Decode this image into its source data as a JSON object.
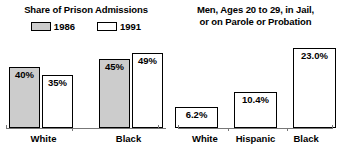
{
  "figure": {
    "background_color": "#ffffff",
    "bar_outline_color": "#000000",
    "axis_color": "#777777"
  },
  "left_panel": {
    "title": "Share of Prison Admissions",
    "legend": [
      {
        "label": "1986",
        "swatch": "gray-swatch-icon",
        "color": "#cccccc"
      },
      {
        "label": "1991",
        "swatch": "white-swatch-icon",
        "color": "#ffffff"
      }
    ]
  },
  "right_panel": {
    "title_line1": "Men, Ages 20 to 29, in Jail,",
    "title_line2": "or on Parole or Probation"
  },
  "chart_data": [
    {
      "type": "bar",
      "title": "Share of Prison Admissions",
      "xlabel": "",
      "ylabel": "",
      "ylim": [
        0,
        55
      ],
      "grid": false,
      "legend_position": "top-center",
      "categories": [
        "White",
        "Black"
      ],
      "series": [
        {
          "name": "1986",
          "color": "#cccccc",
          "values": [
            40,
            45
          ],
          "labels": [
            "40%",
            "45%"
          ]
        },
        {
          "name": "1991",
          "color": "#ffffff",
          "values": [
            35,
            49
          ],
          "labels": [
            "35%",
            "49%"
          ]
        }
      ]
    },
    {
      "type": "bar",
      "title": "Men, Ages 20 to 29, in Jail, or on Parole or Probation",
      "xlabel": "",
      "ylabel": "",
      "ylim": [
        0,
        26
      ],
      "grid": false,
      "legend_position": "none",
      "categories": [
        "White",
        "Hispanic",
        "Black"
      ],
      "series": [
        {
          "name": "Percent in jail or on parole or probation",
          "color": "#ffffff",
          "values": [
            6.2,
            10.4,
            23.0
          ],
          "labels": [
            "6.2%",
            "10.4%",
            "23.0%"
          ]
        }
      ]
    }
  ]
}
